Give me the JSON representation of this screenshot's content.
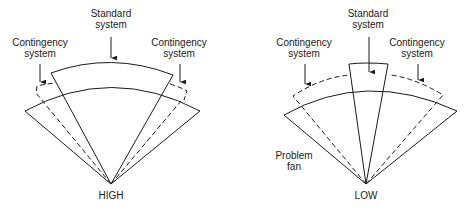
{
  "diagrams": [
    {
      "id": "high",
      "apex_label": "HIGH",
      "labels": {
        "standard": "Standard\nsystem",
        "contingency_left": "Contingency\nsystem",
        "contingency_right": "Contingency\nsystem"
      }
    },
    {
      "id": "low",
      "apex_label": "LOW",
      "labels": {
        "standard": "Standard\nsystem",
        "contingency_left": "Contingency\nsystem",
        "contingency_right": "Contingency\nsystem",
        "problem_fan": "Problem\nfan"
      }
    }
  ],
  "colors": {
    "line": "#1a1a1a",
    "background": "#ffffff"
  }
}
